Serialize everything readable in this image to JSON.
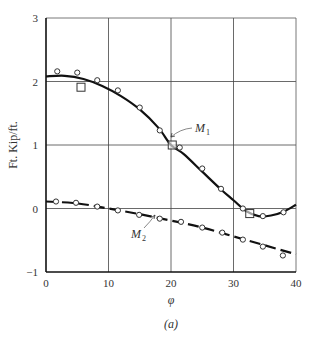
{
  "chart_data": {
    "type": "line",
    "title": "",
    "caption": "(a)",
    "xlabel": "φ",
    "ylabel": "Ft. Kip/ft.",
    "xlim": [
      0,
      40
    ],
    "ylim": [
      -1,
      3
    ],
    "x_ticks": [
      0,
      10,
      20,
      30,
      40
    ],
    "y_ticks": [
      -1,
      0,
      1,
      2,
      3
    ],
    "grid": true,
    "legend": "none (curves labeled inline)",
    "series": [
      {
        "name": "M1",
        "label": "M",
        "subscript": "1",
        "style": "solid",
        "curve": {
          "x": [
            0,
            3,
            6,
            9,
            12,
            15,
            18,
            20,
            22,
            25,
            28,
            30,
            32,
            34,
            36,
            38,
            40
          ],
          "y": [
            2.08,
            2.09,
            2.04,
            1.93,
            1.77,
            1.56,
            1.27,
            1.0,
            0.86,
            0.58,
            0.3,
            0.13,
            -0.04,
            -0.12,
            -0.11,
            -0.05,
            0.06
          ]
        },
        "circles": {
          "x": [
            1.8,
            5.0,
            8.2,
            11.5,
            15.0,
            18.2,
            21.4,
            25.0,
            28.0,
            31.5,
            34.7,
            38.0
          ],
          "y": [
            2.16,
            2.14,
            2.02,
            1.86,
            1.59,
            1.23,
            0.96,
            0.63,
            0.31,
            0.0,
            -0.12,
            -0.06
          ]
        },
        "squares": {
          "x": [
            5.6,
            20.2,
            32.6
          ],
          "y": [
            1.91,
            1.0,
            -0.08
          ]
        }
      },
      {
        "name": "M2",
        "label": "M",
        "subscript": "2",
        "style": "dashed",
        "curve": {
          "x": [
            0,
            5,
            10,
            15,
            20,
            25,
            30,
            35,
            40
          ],
          "y": [
            0.11,
            0.08,
            0.0,
            -0.09,
            -0.19,
            -0.3,
            -0.44,
            -0.58,
            -0.72
          ]
        },
        "circles": {
          "x": [
            1.6,
            4.8,
            8.2,
            11.5,
            14.9,
            18.2,
            21.6,
            25.0,
            28.2,
            31.5,
            34.7,
            37.9
          ],
          "y": [
            0.11,
            0.09,
            0.03,
            -0.03,
            -0.1,
            -0.16,
            -0.21,
            -0.3,
            -0.38,
            -0.49,
            -0.6,
            -0.74
          ]
        }
      }
    ],
    "annotations": [
      {
        "text": "M1",
        "anchor_x": 20,
        "anchor_y": 1.1
      },
      {
        "text": "M2",
        "anchor_x": 17,
        "anchor_y": -0.1
      }
    ]
  }
}
